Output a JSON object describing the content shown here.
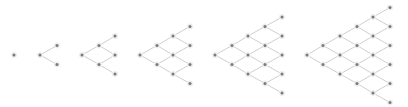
{
  "diagram": {
    "type": "binomial-lattice-trees",
    "colors": {
      "background": "#ffffff",
      "edge": "#cfcfcf",
      "node": "#7a7a7a"
    },
    "node_radius": 1.5,
    "y_center": 55,
    "y_step": 9.5,
    "trees": [
      {
        "name": "tree-steps-0",
        "steps": 0,
        "x_positions": [
          14
        ]
      },
      {
        "name": "tree-steps-1",
        "steps": 1,
        "x_positions": [
          40,
          57
        ]
      },
      {
        "name": "tree-steps-2",
        "steps": 2,
        "x_positions": [
          82,
          99,
          115
        ]
      },
      {
        "name": "tree-steps-3",
        "steps": 3,
        "x_positions": [
          140,
          157,
          173,
          190
        ]
      },
      {
        "name": "tree-steps-4",
        "steps": 4,
        "x_positions": [
          215,
          232,
          248,
          265,
          282
        ]
      },
      {
        "name": "tree-steps-5",
        "steps": 5,
        "x_positions": [
          307,
          323,
          340,
          357,
          373,
          390
        ]
      }
    ]
  }
}
